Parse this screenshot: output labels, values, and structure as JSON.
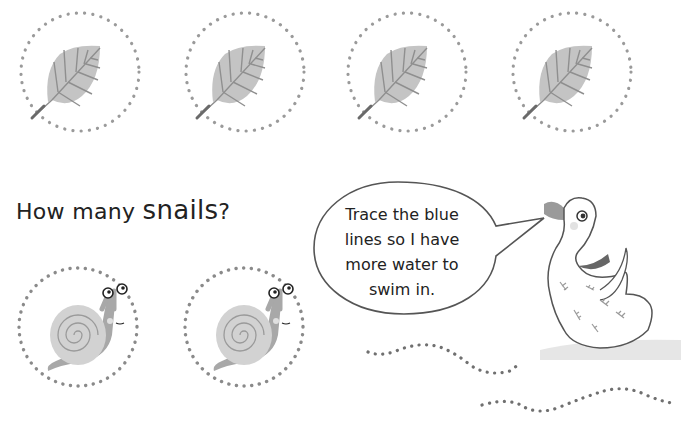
{
  "question": {
    "prefix": "How many ",
    "emphasis": "snails",
    "suffix": "?"
  },
  "speech_bubble": {
    "lines": [
      "Trace the blue",
      "lines so I have",
      "more water to",
      "swim in."
    ]
  },
  "leaves": {
    "count": 4,
    "icon": "leaf-icon"
  },
  "snails": {
    "count": 2,
    "icon": "snail-icon"
  },
  "duck": {
    "icon": "duck-icon"
  },
  "tracing_lines": {
    "count": 2
  },
  "colors": {
    "dots": "#8a8a8a",
    "leaf": "#c4c4c4",
    "leaf_vein": "#8f8f8f",
    "snail_shell": "#d2d2d2",
    "snail_body": "#a8a8a8",
    "text": "#222222"
  }
}
